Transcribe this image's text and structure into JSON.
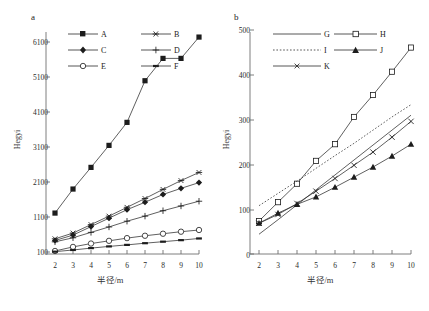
{
  "figure": {
    "panel_a_tag": "a",
    "panel_b_tag": "b"
  },
  "chart_data": [
    {
      "type": "line",
      "panel": "a",
      "title": "a",
      "xlabel": "半径/m",
      "ylabel": "Hegyi",
      "x": [
        2,
        3,
        4,
        5,
        6,
        7,
        8,
        9,
        10
      ],
      "xlim": [
        2,
        10
      ],
      "ylim": [
        100,
        6600
      ],
      "xticks": [
        "2",
        "3",
        "4",
        "5",
        "6",
        "7",
        "8",
        "9",
        "10"
      ],
      "yticks": [
        "100",
        "1100",
        "2100",
        "3100",
        "4100",
        "5100",
        "6100"
      ],
      "ytick_values": [
        100,
        1100,
        2100,
        3100,
        4100,
        5100,
        6100
      ],
      "grid": false,
      "legend_position": "upper-left",
      "series": [
        {
          "name": "A",
          "marker": "filled-square",
          "values": [
            1250,
            1960,
            2600,
            3250,
            3930,
            5160,
            5820,
            5820,
            6450
          ]
        },
        {
          "name": "B",
          "marker": "asterisk",
          "values": [
            490,
            660,
            910,
            1160,
            1420,
            1680,
            1950,
            2210,
            2450
          ]
        },
        {
          "name": "C",
          "marker": "filled-diamond",
          "values": [
            440,
            600,
            850,
            1100,
            1350,
            1570,
            1800,
            1980,
            2150
          ]
        },
        {
          "name": "D",
          "marker": "plus",
          "values": [
            400,
            520,
            680,
            840,
            1010,
            1160,
            1320,
            1460,
            1600
          ]
        },
        {
          "name": "E",
          "marker": "open-diamond",
          "values": [
            130,
            250,
            350,
            430,
            510,
            580,
            640,
            700,
            750
          ]
        },
        {
          "name": "F",
          "marker": "small-dash",
          "values": [
            110,
            160,
            215,
            265,
            310,
            360,
            405,
            450,
            500
          ]
        }
      ]
    },
    {
      "type": "line",
      "panel": "b",
      "title": "b",
      "xlabel": "半径/m",
      "ylabel": "Hegyi",
      "x": [
        2,
        3,
        4,
        5,
        6,
        7,
        8,
        9,
        10
      ],
      "xlim": [
        2,
        10
      ],
      "ylim": [
        0,
        510
      ],
      "xticks": [
        "2",
        "3",
        "4",
        "5",
        "6",
        "7",
        "8",
        "9",
        "10"
      ],
      "yticks": [
        "0",
        "100",
        "200",
        "300",
        "400",
        "500"
      ],
      "ytick_values": [
        0,
        100,
        200,
        300,
        400,
        500
      ],
      "grid": false,
      "legend_position": "upper-left",
      "series": [
        {
          "name": "G",
          "marker": "none",
          "values": [
            45,
            78,
            112,
            146,
            180,
            214,
            248,
            282,
            316
          ]
        },
        {
          "name": "H",
          "marker": "open-square",
          "values": [
            75,
            118,
            160,
            212,
            250,
            312,
            362,
            415,
            470
          ]
        },
        {
          "name": "I",
          "marker": "none",
          "linestyle": "dotted",
          "values": [
            110,
            138,
            166,
            195,
            224,
            252,
            282,
            312,
            340
          ]
        },
        {
          "name": "J",
          "marker": "filled-triangle",
          "values": [
            70,
            93,
            113,
            130,
            152,
            175,
            198,
            223,
            250
          ]
        },
        {
          "name": "K",
          "marker": "x",
          "values": [
            70,
            90,
            115,
            143,
            172,
            202,
            232,
            266,
            302
          ]
        }
      ]
    }
  ],
  "panel_a": {
    "tag": "a",
    "ylabel": "Hegyi",
    "xlabel": "半径/m",
    "yticks": [
      "6100",
      "5100",
      "4100",
      "3100",
      "2100",
      "1100",
      "100"
    ],
    "xticks": [
      "2",
      "3",
      "4",
      "5",
      "6",
      "7",
      "8",
      "9",
      "10"
    ],
    "legend": [
      {
        "label": "A",
        "marker": "filled-square"
      },
      {
        "label": "B",
        "marker": "asterisk"
      },
      {
        "label": "C",
        "marker": "filled-diamond"
      },
      {
        "label": "D",
        "marker": "plus"
      },
      {
        "label": "E",
        "marker": "open-diamond"
      },
      {
        "label": "F",
        "marker": "small-dash"
      }
    ]
  },
  "panel_b": {
    "tag": "b",
    "ylabel": "Hegyi",
    "xlabel": "半径/m",
    "yticks": [
      "500",
      "400",
      "300",
      "200",
      "100",
      "0"
    ],
    "xticks": [
      "2",
      "3",
      "4",
      "5",
      "6",
      "7",
      "8",
      "9",
      "10"
    ],
    "legend": [
      {
        "label": "G",
        "marker": "none"
      },
      {
        "label": "H",
        "marker": "open-square"
      },
      {
        "label": "I",
        "marker": "dotted-line"
      },
      {
        "label": "J",
        "marker": "filled-triangle"
      },
      {
        "label": "K",
        "marker": "x"
      }
    ]
  }
}
